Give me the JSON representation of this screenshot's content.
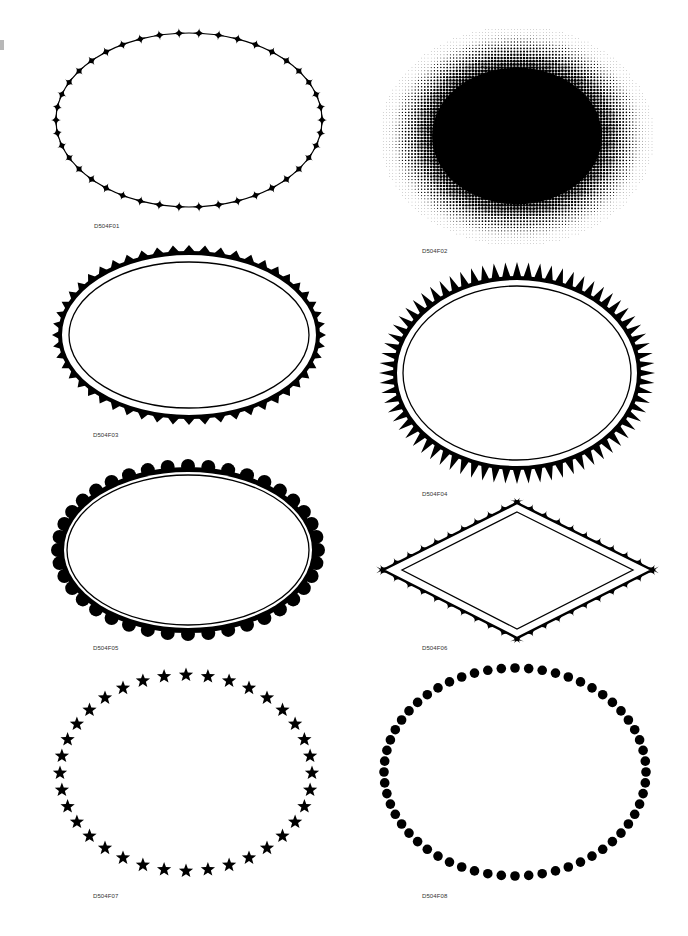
{
  "page": {
    "background": "#ffffff",
    "ink": "#000000"
  },
  "frames": [
    {
      "id": "D504F01",
      "label": "D504F01",
      "style": "diamond-beaded-oval",
      "count": 42
    },
    {
      "id": "D504F02",
      "label": "D504F02",
      "style": "halftone-oval"
    },
    {
      "id": "D504F03",
      "label": "D504F03",
      "style": "sawtooth-oval-double-rule",
      "count": 52
    },
    {
      "id": "D504F04",
      "label": "D504F04",
      "style": "spiked-oval-double-rule",
      "count": 72
    },
    {
      "id": "D504F05",
      "label": "D504F05",
      "style": "scalloped-oval-double-rule",
      "count": 40
    },
    {
      "id": "D504F06",
      "label": "D504F06",
      "style": "scalloped-diamond-double-rule",
      "count": 40
    },
    {
      "id": "D504F07",
      "label": "D504F07",
      "style": "star-oval",
      "count": 36
    },
    {
      "id": "D504F08",
      "label": "D504F08",
      "style": "dot-oval",
      "count": 60
    }
  ]
}
